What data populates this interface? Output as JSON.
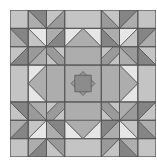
{
  "image": {
    "title": "Quilt block pattern",
    "description": "Symmetric grayscale quilt block with star corners and a central on-point square"
  },
  "palette": {
    "light": "#e6e6e6",
    "mid_light": "#c4c4c4",
    "mid": "#adadad",
    "mid_dark": "#9a9a9a",
    "dark": "#858585",
    "center": "#8c8c8c",
    "line": "#555555"
  }
}
